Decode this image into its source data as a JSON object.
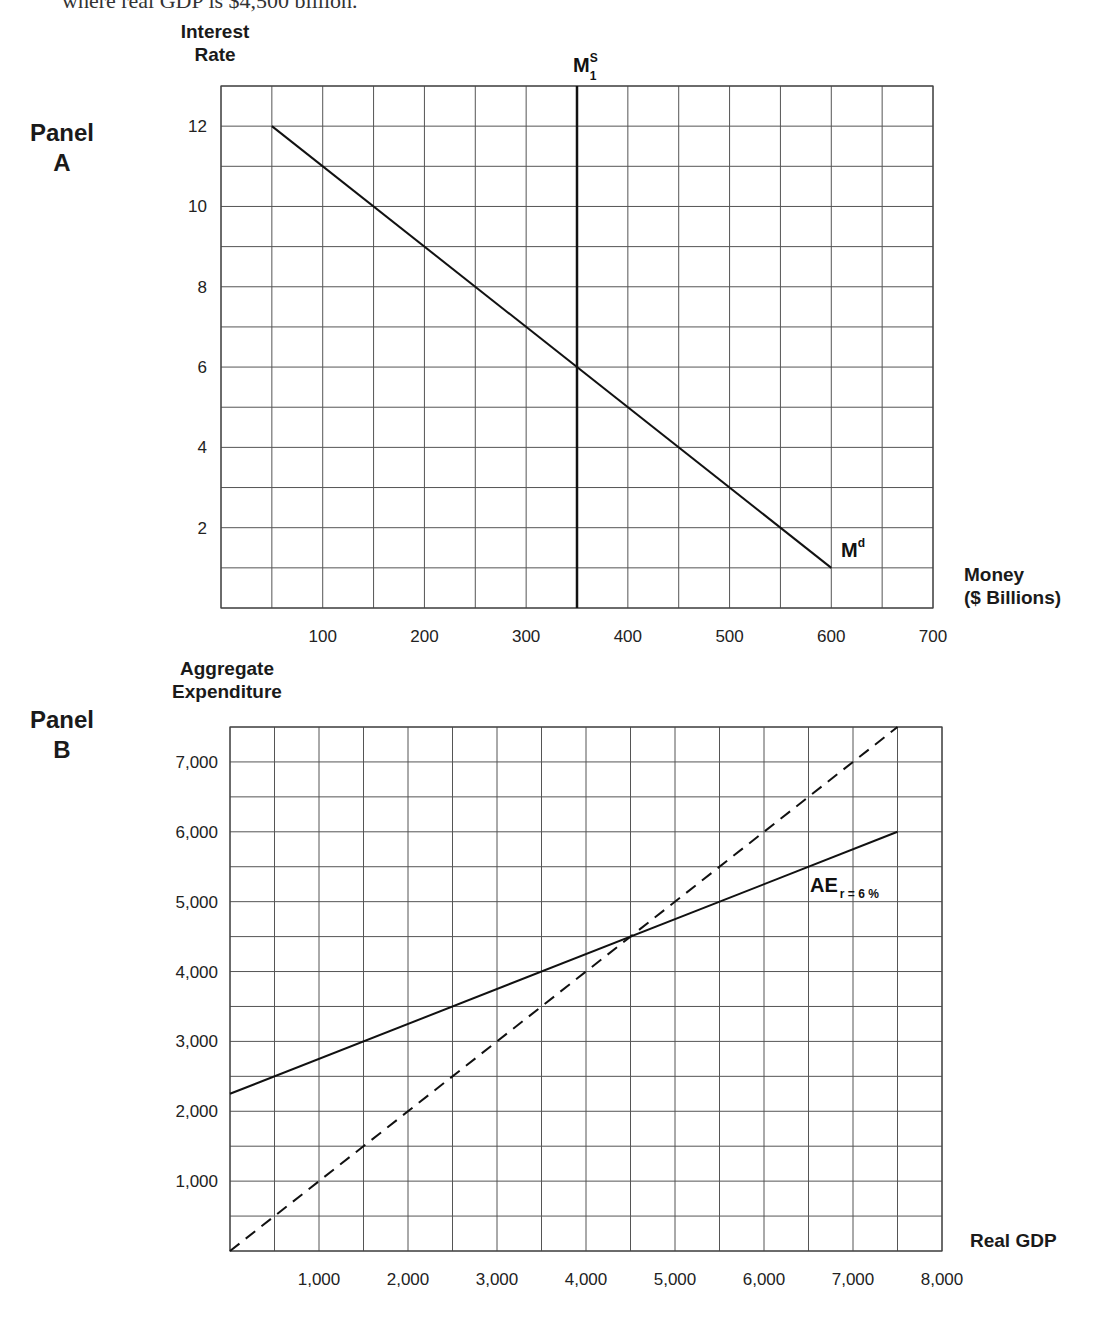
{
  "header": {
    "cut_off_text": "where real GDP is $4,500 billion."
  },
  "panel_a": {
    "label_line1": "Panel",
    "label_line2": "A",
    "y_title_line1": "Interest",
    "y_title_line2": "Rate",
    "x_title_line1": "Money",
    "x_title_line2": "($ Billions)",
    "supply_label": "M",
    "supply_sup": "S",
    "supply_sub": "1",
    "demand_label": "M",
    "demand_sup": "d"
  },
  "panel_b": {
    "label_line1": "Panel",
    "label_line2": "B",
    "y_title_line1": "Aggregate",
    "y_title_line2": "Expenditure",
    "x_title": "Real GDP",
    "ae_label": "AE",
    "ae_sub": "r = 6 %"
  },
  "chart_data": [
    {
      "type": "line",
      "title": "Panel A",
      "xlabel": "Money ($ Billions)",
      "ylabel": "Interest Rate",
      "xlim": [
        0,
        700
      ],
      "ylim": [
        0,
        13
      ],
      "grid": true,
      "grid_step_x": 50,
      "grid_step_y": 1,
      "x_ticks": [
        100,
        200,
        300,
        400,
        500,
        600,
        700
      ],
      "y_ticks": [
        2,
        4,
        6,
        8,
        10,
        12
      ],
      "series": [
        {
          "name": "Md",
          "style": "solid",
          "x": [
            50,
            600
          ],
          "y": [
            12,
            1
          ]
        },
        {
          "name": "MS1",
          "style": "solid-thick",
          "x": [
            350,
            350
          ],
          "y": [
            0,
            13
          ]
        }
      ]
    },
    {
      "type": "line",
      "title": "Panel B",
      "xlabel": "Real GDP",
      "ylabel": "Aggregate Expenditure",
      "xlim": [
        0,
        8000
      ],
      "ylim": [
        0,
        7500
      ],
      "grid": true,
      "grid_step_x": 500,
      "grid_step_y": 500,
      "x_ticks": [
        "1,000",
        "2,000",
        "3,000",
        "4,000",
        "5,000",
        "6,000",
        "7,000",
        "8,000"
      ],
      "y_ticks": [
        "1,000",
        "2,000",
        "3,000",
        "4,000",
        "5,000",
        "6,000",
        "7,000"
      ],
      "series": [
        {
          "name": "AE r = 6%",
          "style": "solid",
          "x": [
            0,
            7500
          ],
          "y": [
            2250,
            6000
          ]
        },
        {
          "name": "45-degree line",
          "style": "dashed",
          "x": [
            0,
            7500
          ],
          "y": [
            0,
            7500
          ]
        }
      ],
      "annotations": [
        {
          "text": "equilibrium",
          "x": 4500,
          "y": 4500
        }
      ]
    }
  ]
}
